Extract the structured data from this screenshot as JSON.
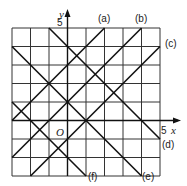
{
  "diagram": {
    "title": "",
    "grid": {
      "xmin": -3,
      "xmax": 5,
      "ymin": -3,
      "ymax": 5
    },
    "axes": {
      "x_label": "x",
      "y_label": "y",
      "x_tick": "5",
      "y_tick": "5",
      "origin_label": "O"
    },
    "lines": [
      {
        "id": "a",
        "label": "(a)",
        "from": [
          -3,
          0
        ],
        "to": [
          2,
          5
        ]
      },
      {
        "id": "b",
        "label": "(b)",
        "from": [
          -3,
          -2
        ],
        "to": [
          4,
          5
        ]
      },
      {
        "id": "c",
        "label": "(c)",
        "from": [
          -2,
          -3
        ],
        "to": [
          5,
          4
        ]
      },
      {
        "id": "d",
        "label": "(d)",
        "from": [
          -1,
          5
        ],
        "to": [
          5,
          -1
        ]
      },
      {
        "id": "e",
        "label": "(e)",
        "from": [
          -3,
          4
        ],
        "to": [
          4,
          -3
        ]
      },
      {
        "id": "f",
        "label": "(f)",
        "from": [
          -3,
          1
        ],
        "to": [
          1,
          -3
        ]
      }
    ]
  }
}
